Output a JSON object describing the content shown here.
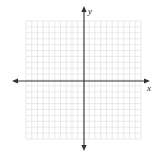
{
  "diagram": {
    "type": "coordinate-plane",
    "grid": {
      "columns": 20,
      "rows": 20,
      "left": 26,
      "top": 21,
      "right": 141,
      "bottom": 139,
      "line_color": "#dcdcdc"
    },
    "axes": {
      "origin": {
        "x": 84,
        "y": 81
      },
      "x_axis": {
        "label": "x",
        "from": 12,
        "to": 150,
        "arrows": "both"
      },
      "y_axis": {
        "label": "y",
        "from": 6,
        "to": 151,
        "arrows": "both"
      },
      "color": "#333333"
    }
  }
}
